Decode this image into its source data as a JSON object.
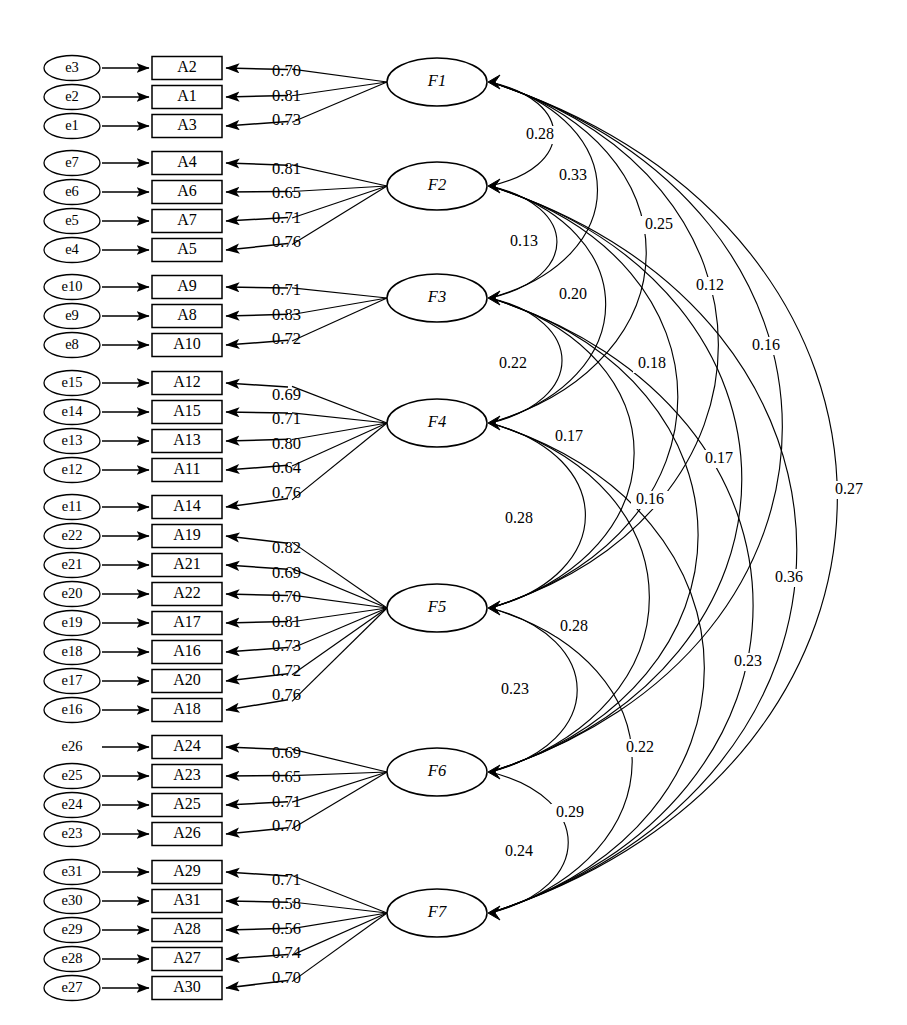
{
  "figure": {
    "type": "sem-path-diagram",
    "title_fragment": "",
    "width": 907,
    "height": 1025,
    "background": "#ffffff",
    "ink_color": "#000000"
  },
  "indicators": [
    {
      "error": "e3",
      "box": "A2",
      "loading": "0.70",
      "factor": "F1"
    },
    {
      "error": "e2",
      "box": "A1",
      "loading": "0.81",
      "factor": "F1"
    },
    {
      "error": "e1",
      "box": "A3",
      "loading": "0.73",
      "factor": "F1"
    },
    {
      "error": "e7",
      "box": "A4",
      "loading": "0.81",
      "factor": "F2"
    },
    {
      "error": "e6",
      "box": "A6",
      "loading": "0.65",
      "factor": "F2"
    },
    {
      "error": "e5",
      "box": "A7",
      "loading": "0.71",
      "factor": "F2"
    },
    {
      "error": "e4",
      "box": "A5",
      "loading": "0.76",
      "factor": "F2"
    },
    {
      "error": "e10",
      "box": "A9",
      "loading": "0.71",
      "factor": "F3"
    },
    {
      "error": "e9",
      "box": "A8",
      "loading": "0.83",
      "factor": "F3"
    },
    {
      "error": "e8",
      "box": "A10",
      "loading": "0.72",
      "factor": "F3"
    },
    {
      "error": "e15",
      "box": "A12",
      "loading": "0.69",
      "factor": "F4"
    },
    {
      "error": "e14",
      "box": "A15",
      "loading": "0.71",
      "factor": "F4"
    },
    {
      "error": "e13",
      "box": "A13",
      "loading": "0.80",
      "factor": "F4"
    },
    {
      "error": "e12",
      "box": "A11",
      "loading": "0.64",
      "factor": "F4"
    },
    {
      "error": "e11",
      "box": "A14",
      "loading": "0.76",
      "factor": "F4"
    },
    {
      "error": "e22",
      "box": "A19",
      "loading": "0.82",
      "factor": "F5"
    },
    {
      "error": "e21",
      "box": "A21",
      "loading": "0.69",
      "factor": "F5"
    },
    {
      "error": "e20",
      "box": "A22",
      "loading": "0.70",
      "factor": "F5"
    },
    {
      "error": "e19",
      "box": "A17",
      "loading": "0.81",
      "factor": "F5"
    },
    {
      "error": "e18",
      "box": "A16",
      "loading": "0.73",
      "factor": "F5"
    },
    {
      "error": "e17",
      "box": "A20",
      "loading": "0.72",
      "factor": "F5"
    },
    {
      "error": "e16",
      "box": "A18",
      "loading": "0.76",
      "factor": "F5"
    },
    {
      "error": "e26",
      "box": "A24",
      "loading": "0.69",
      "factor": "F6"
    },
    {
      "error": "e25",
      "box": "A23",
      "loading": "0.65",
      "factor": "F6"
    },
    {
      "error": "e24",
      "box": "A25",
      "loading": "0.71",
      "factor": "F6"
    },
    {
      "error": "e23",
      "box": "A26",
      "loading": "0.70",
      "factor": "F6"
    },
    {
      "error": "e31",
      "box": "A29",
      "loading": "0.71",
      "factor": "F7"
    },
    {
      "error": "e30",
      "box": "A31",
      "loading": "0.58",
      "factor": "F7"
    },
    {
      "error": "e29",
      "box": "A28",
      "loading": "0.56",
      "factor": "F7"
    },
    {
      "error": "e28",
      "box": "A27",
      "loading": "0.74",
      "factor": "F7"
    },
    {
      "error": "e27",
      "box": "A30",
      "loading": "0.70",
      "factor": "F7"
    }
  ],
  "factors": [
    {
      "label": "F1",
      "cy": 82
    },
    {
      "label": "F2",
      "cy": 186
    },
    {
      "label": "F3",
      "cy": 298
    },
    {
      "label": "F4",
      "cy": 423
    },
    {
      "label": "F5",
      "cy": 608
    },
    {
      "label": "F6",
      "cy": 772
    },
    {
      "label": "F7",
      "cy": 913
    }
  ],
  "correlations": [
    {
      "from": "F1",
      "to": "F2",
      "value": "0.28",
      "lx": 540,
      "ly": 135
    },
    {
      "from": "F2",
      "to": "F3",
      "value": "0.13",
      "lx": 524,
      "ly": 242
    },
    {
      "from": "F1",
      "to": "F3",
      "value": "0.33",
      "lx": 573,
      "ly": 176
    },
    {
      "from": "F2",
      "to": "F4",
      "value": "0.20",
      "lx": 573,
      "ly": 295
    },
    {
      "from": "F3",
      "to": "F4",
      "value": "0.22",
      "lx": 513,
      "ly": 364
    },
    {
      "from": "F1",
      "to": "F4",
      "value": "0.25",
      "lx": 659,
      "ly": 225
    },
    {
      "from": "F3",
      "to": "F5",
      "value": "0.17",
      "lx": 569,
      "ly": 437
    },
    {
      "from": "F2",
      "to": "F5",
      "value": "0.18",
      "lx": 652,
      "ly": 364
    },
    {
      "from": "F1",
      "to": "F5",
      "value": "0.12",
      "lx": 710,
      "ly": 286
    },
    {
      "from": "F4",
      "to": "F5",
      "value": "0.28",
      "lx": 519,
      "ly": 519
    },
    {
      "from": "F3",
      "to": "F6",
      "value": "0.16",
      "lx": 650,
      "ly": 500
    },
    {
      "from": "F2",
      "to": "F6",
      "value": "0.17",
      "lx": 719,
      "ly": 459
    },
    {
      "from": "F1",
      "to": "F6",
      "value": "0.16",
      "lx": 766,
      "ly": 346
    },
    {
      "from": "F4",
      "to": "F6",
      "value": "0.28",
      "lx": 574,
      "ly": 627
    },
    {
      "from": "F5",
      "to": "F6",
      "value": "0.23",
      "lx": 515,
      "ly": 690
    },
    {
      "from": "F4",
      "to": "F7",
      "value": "0.22",
      "lx": 640,
      "ly": 748
    },
    {
      "from": "F3",
      "to": "F7",
      "value": "0.23",
      "lx": 748,
      "ly": 662
    },
    {
      "from": "F2",
      "to": "F7",
      "value": "0.36",
      "lx": 789,
      "ly": 578
    },
    {
      "from": "F1",
      "to": "F7",
      "value": "0.27",
      "lx": 849,
      "ly": 490
    },
    {
      "from": "F5",
      "to": "F7",
      "value": "0.29",
      "lx": 570,
      "ly": 813
    },
    {
      "from": "F6",
      "to": "F7",
      "value": "0.24",
      "lx": 519,
      "ly": 852
    }
  ],
  "loading_labels_x": 272,
  "groups": [
    {
      "factor": "F1",
      "count": 3
    },
    {
      "factor": "F2",
      "count": 4
    },
    {
      "factor": "F3",
      "count": 3
    },
    {
      "factor": "F4",
      "count": 5
    },
    {
      "factor": "F5",
      "count": 7
    },
    {
      "factor": "F6",
      "count": 4
    },
    {
      "factor": "F7",
      "count": 5
    }
  ]
}
